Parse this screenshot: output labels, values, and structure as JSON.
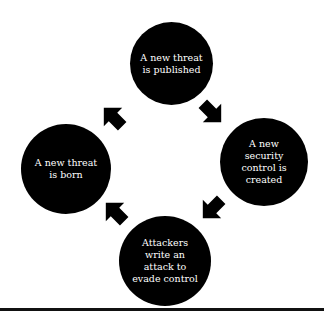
{
  "diagram": {
    "type": "cycle",
    "nodes": [
      {
        "id": "top",
        "label": "A new threat is published",
        "lines": [
          "A new threat",
          "is published"
        ]
      },
      {
        "id": "right",
        "label": "A new security control is created",
        "lines": [
          "A new",
          "security",
          "control is",
          "created"
        ]
      },
      {
        "id": "bottom",
        "label": "Attackers write an attack to evade control",
        "lines": [
          "Attackers",
          "write an",
          "attack to",
          "evade control"
        ]
      },
      {
        "id": "left",
        "label": "A new threat is born",
        "lines": [
          "A new threat",
          "is born"
        ]
      }
    ],
    "edges": [
      {
        "from": "left",
        "to": "top",
        "icon": "arrow-up-right-icon"
      },
      {
        "from": "top",
        "to": "right",
        "icon": "arrow-down-right-icon"
      },
      {
        "from": "right",
        "to": "bottom",
        "icon": "arrow-down-left-icon"
      },
      {
        "from": "bottom",
        "to": "left",
        "icon": "arrow-up-left-icon"
      }
    ],
    "colors": {
      "node_fill": "#000000",
      "node_text": "#ffffff",
      "arrow": "#000000",
      "rule": "#111111",
      "background": "#ffffff"
    }
  }
}
